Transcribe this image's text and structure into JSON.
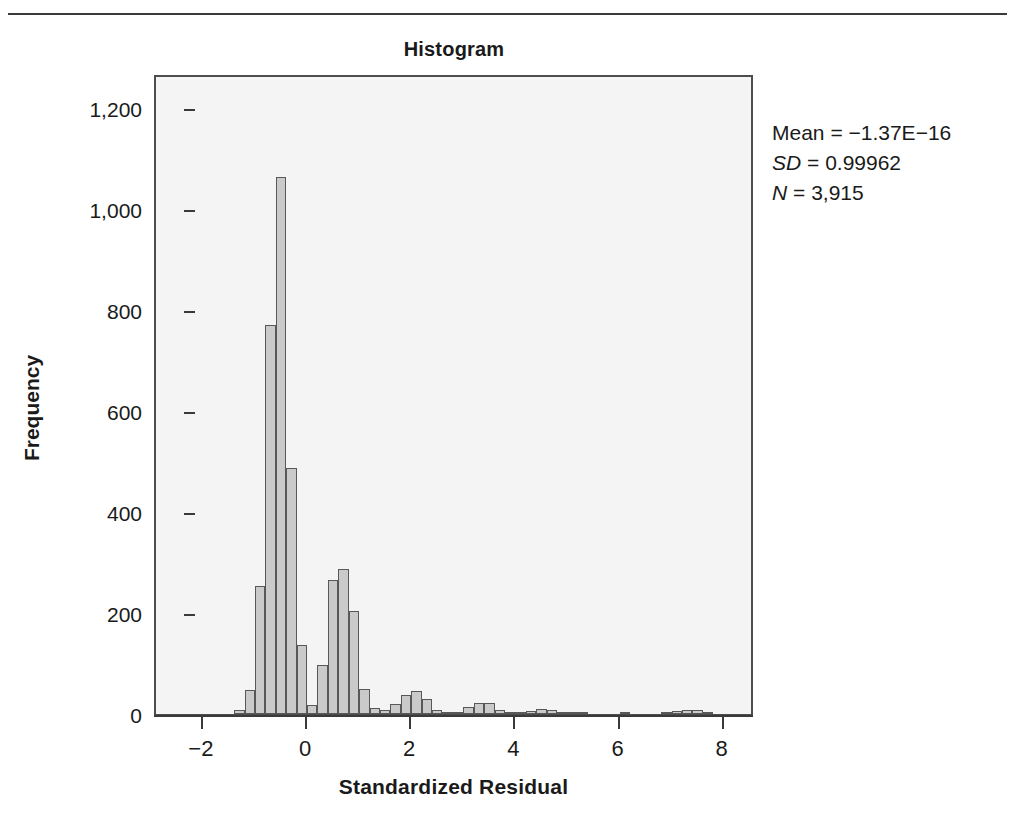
{
  "chart_data": {
    "type": "bar",
    "title": "Histogram",
    "xlabel": "Standardized Residual",
    "ylabel": "Frequency",
    "xlim": [
      -2.9,
      8.6
    ],
    "ylim": [
      0,
      1270
    ],
    "grid": false,
    "legend": "none",
    "xticks": [
      "−2",
      "0",
      "2",
      "4",
      "6",
      "8"
    ],
    "xtick_values": [
      -2,
      0,
      2,
      4,
      6,
      8
    ],
    "yticks": [
      "0",
      "200",
      "400",
      "600",
      "800",
      "1,000",
      "1,200"
    ],
    "ytick_values": [
      0,
      200,
      400,
      600,
      800,
      1000,
      1200
    ],
    "bin_width": 0.2,
    "bin_centers": [
      -1.3,
      -1.1,
      -0.9,
      -0.7,
      -0.5,
      -0.3,
      -0.1,
      0.1,
      0.3,
      0.5,
      0.7,
      0.9,
      1.1,
      1.3,
      1.5,
      1.7,
      1.9,
      2.1,
      2.3,
      2.5,
      2.7,
      2.9,
      3.1,
      3.3,
      3.5,
      3.7,
      3.9,
      4.1,
      4.3,
      4.5,
      4.7,
      4.9,
      5.1,
      5.3,
      6.1,
      6.9,
      7.1,
      7.3,
      7.5,
      7.7
    ],
    "values": [
      8,
      47,
      253,
      770,
      1063,
      487,
      136,
      18,
      98,
      265,
      288,
      205,
      50,
      12,
      8,
      20,
      37,
      46,
      30,
      7,
      3,
      4,
      13,
      22,
      21,
      7,
      2,
      3,
      5,
      9,
      8,
      4,
      2,
      1,
      2,
      3,
      6,
      8,
      7,
      3
    ],
    "bar_fill": "#cacaca",
    "bar_border": "#585858",
    "plot_background": "#f4f4f4"
  },
  "annotation": {
    "mean_label": "Mean",
    "mean_value": "−1.37E−16",
    "sd_label": "SD",
    "sd_value": "0.99962",
    "n_label": "N",
    "n_value": "3,915",
    "equals": "="
  }
}
